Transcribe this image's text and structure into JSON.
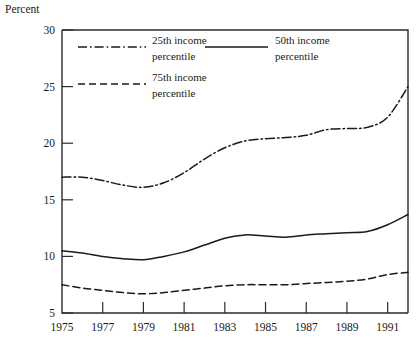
{
  "chart_data": {
    "type": "line",
    "title": "",
    "ylabel": "Percent",
    "xlabel": "",
    "ylim": [
      5,
      30
    ],
    "xlim": [
      1975,
      1992
    ],
    "grid": false,
    "legend_position": "inside-top",
    "y_ticks": [
      5,
      10,
      15,
      20,
      25,
      30
    ],
    "y_tick_labels": [
      "5",
      "10",
      "15",
      "20",
      "25",
      "30"
    ],
    "x_ticks": [
      1975,
      1977,
      1979,
      1981,
      1983,
      1985,
      1987,
      1989,
      1991
    ],
    "x_tick_labels": [
      "1975",
      "1977",
      "1979",
      "1981",
      "1983",
      "1985",
      "1987",
      "1989",
      "1991"
    ],
    "x": [
      1975,
      1976,
      1977,
      1978,
      1979,
      1980,
      1981,
      1982,
      1983,
      1984,
      1985,
      1986,
      1987,
      1988,
      1989,
      1990,
      1991,
      1992
    ],
    "series": [
      {
        "name": "25th income percentile",
        "style": "dash-dot",
        "values": [
          17.0,
          17.0,
          16.7,
          16.3,
          16.1,
          16.5,
          17.4,
          18.6,
          19.6,
          20.2,
          20.4,
          20.5,
          20.7,
          21.2,
          21.3,
          21.4,
          22.3,
          25.0
        ]
      },
      {
        "name": "50th income percentile",
        "style": "solid",
        "values": [
          10.5,
          10.3,
          10.0,
          9.8,
          9.7,
          10.0,
          10.4,
          11.0,
          11.6,
          11.9,
          11.8,
          11.7,
          11.9,
          12.0,
          12.1,
          12.2,
          12.8,
          13.7
        ]
      },
      {
        "name": "75th income percentile",
        "style": "dashed",
        "values": [
          7.5,
          7.2,
          7.0,
          6.8,
          6.7,
          6.8,
          7.0,
          7.2,
          7.4,
          7.5,
          7.5,
          7.5,
          7.6,
          7.7,
          7.8,
          8.0,
          8.4,
          8.6
        ]
      }
    ]
  },
  "legend": {
    "entries": [
      {
        "label_line1": "25th income",
        "label_line2": "percentile",
        "style": "dash-dot"
      },
      {
        "label_line1": "50th income",
        "label_line2": "percentile",
        "style": "solid"
      },
      {
        "label_line1": "75th income",
        "label_line2": "percentile",
        "style": "dashed"
      }
    ]
  }
}
